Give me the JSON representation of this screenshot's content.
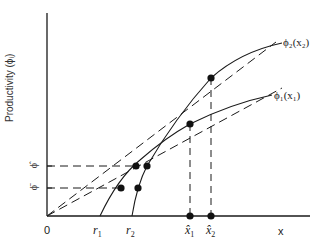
{
  "diagram": {
    "y_axis_label": "Productivity (ϕᵢ)",
    "x_axis_label": "x",
    "origin_label": "0",
    "y_ticks": [
      {
        "label": "ϕ̂",
        "y": 166
      },
      {
        "label": "ϕ̄",
        "y": 188
      }
    ],
    "x_ticks": [
      {
        "label": "r",
        "sub": "1",
        "x": 100
      },
      {
        "label": "r",
        "sub": "2",
        "x": 132
      },
      {
        "label": "x̂",
        "sub": "1",
        "x": 190
      },
      {
        "label": "x̂",
        "sub": "2",
        "x": 211
      }
    ],
    "curves": [
      {
        "name": "phi2",
        "label": "ϕ₂(x₂)",
        "start": "r2"
      },
      {
        "name": "phi1",
        "label": "ϕ₁(x₁)",
        "start": "r1"
      }
    ],
    "colors": {
      "ink": "#1a1a1a",
      "background": "#ffffff"
    }
  }
}
